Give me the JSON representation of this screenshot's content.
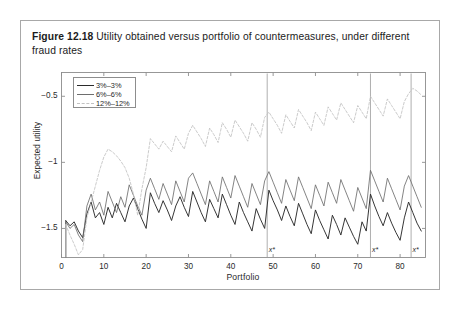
{
  "caption": {
    "label": "Figure 12.18",
    "text": "Utility obtained versus portfolio of countermeasures, under different fraud rates"
  },
  "colors": {
    "frame": "#8d8d8d",
    "series_3": "#2b2b2b",
    "series_6": "#6e6e6e",
    "series_12": "#c2c2c2",
    "text": "#231f20",
    "card_border": "#a8a8a8"
  },
  "legend": {
    "position": "top-left-inside",
    "items": [
      {
        "label": "3%–3%",
        "color": "#2b2b2b",
        "style": "solid"
      },
      {
        "label": "6%–6%",
        "color": "#6e6e6e",
        "style": "solid"
      },
      {
        "label": "12%–12%",
        "color": "#c2c2c2",
        "style": "dashed"
      }
    ]
  },
  "annotations": [
    {
      "label": "x*",
      "x": 48.6
    },
    {
      "label": "x*",
      "x": 73.0
    },
    {
      "label": "x*",
      "x": 82.6
    }
  ],
  "chart_data": {
    "type": "line",
    "title": "",
    "subtitle": "",
    "xlabel": "Portfolio",
    "ylabel": "Expected utility",
    "xlim": [
      0,
      86
    ],
    "ylim": [
      -1.72,
      -0.32
    ],
    "xticks": [
      0,
      10,
      20,
      30,
      40,
      50,
      60,
      70,
      80
    ],
    "yticks": [
      -0.5,
      -1,
      -1.5
    ],
    "ytick_labels": [
      "−0.5",
      "−1",
      "−1.5"
    ],
    "grid": false,
    "legend_position": "upper left",
    "series": [
      {
        "name": "3%–3%",
        "color": "#2b2b2b",
        "style": "solid",
        "x": [
          1,
          2,
          3,
          4,
          5,
          6,
          7,
          8,
          9,
          10,
          11,
          12,
          13,
          14,
          15,
          16,
          17,
          18,
          19,
          20,
          21,
          22,
          23,
          24,
          25,
          26,
          27,
          28,
          29,
          30,
          31,
          32,
          33,
          34,
          35,
          36,
          37,
          38,
          39,
          40,
          41,
          42,
          43,
          44,
          45,
          46,
          47,
          48,
          49,
          50,
          51,
          52,
          53,
          54,
          55,
          56,
          57,
          58,
          59,
          60,
          61,
          62,
          63,
          64,
          65,
          66,
          67,
          68,
          69,
          70,
          71,
          72,
          73,
          74,
          75,
          76,
          77,
          78,
          79,
          80,
          81,
          82,
          83,
          84,
          85
        ],
        "values": [
          -1.44,
          -1.48,
          -1.45,
          -1.52,
          -1.57,
          -1.39,
          -1.3,
          -1.42,
          -1.38,
          -1.47,
          -1.34,
          -1.42,
          -1.31,
          -1.38,
          -1.45,
          -1.33,
          -1.27,
          -1.35,
          -1.43,
          -1.5,
          -1.23,
          -1.31,
          -1.38,
          -1.29,
          -1.36,
          -1.44,
          -1.33,
          -1.26,
          -1.34,
          -1.41,
          -1.22,
          -1.3,
          -1.38,
          -1.45,
          -1.28,
          -1.35,
          -1.42,
          -1.24,
          -1.32,
          -1.4,
          -1.47,
          -1.3,
          -1.38,
          -1.45,
          -1.52,
          -1.35,
          -1.43,
          -1.5,
          -1.21,
          -1.29,
          -1.36,
          -1.44,
          -1.33,
          -1.41,
          -1.48,
          -1.31,
          -1.39,
          -1.47,
          -1.54,
          -1.36,
          -1.44,
          -1.51,
          -1.58,
          -1.4,
          -1.47,
          -1.55,
          -1.42,
          -1.49,
          -1.56,
          -1.62,
          -1.45,
          -1.52,
          -1.24,
          -1.33,
          -1.41,
          -1.48,
          -1.38,
          -1.46,
          -1.53,
          -1.59,
          -1.42,
          -1.3,
          -1.38,
          -1.46,
          -1.52
        ]
      },
      {
        "name": "6%–6%",
        "color": "#6e6e6e",
        "style": "solid",
        "x": [
          1,
          2,
          3,
          4,
          5,
          6,
          7,
          8,
          9,
          10,
          11,
          12,
          13,
          14,
          15,
          16,
          17,
          18,
          19,
          20,
          21,
          22,
          23,
          24,
          25,
          26,
          27,
          28,
          29,
          30,
          31,
          32,
          33,
          34,
          35,
          36,
          37,
          38,
          39,
          40,
          41,
          42,
          43,
          44,
          45,
          46,
          47,
          48,
          49,
          50,
          51,
          52,
          53,
          54,
          55,
          56,
          57,
          58,
          59,
          60,
          61,
          62,
          63,
          64,
          65,
          66,
          67,
          68,
          69,
          70,
          71,
          72,
          73,
          74,
          75,
          76,
          77,
          78,
          79,
          80,
          81,
          82,
          83,
          84,
          85
        ],
        "values": [
          -1.45,
          -1.5,
          -1.47,
          -1.55,
          -1.6,
          -1.33,
          -1.24,
          -1.36,
          -1.3,
          -1.4,
          -1.22,
          -1.3,
          -1.38,
          -1.26,
          -1.34,
          -1.17,
          -1.25,
          -1.33,
          -1.4,
          -1.21,
          -1.12,
          -1.2,
          -1.28,
          -1.16,
          -1.24,
          -1.32,
          -1.14,
          -1.22,
          -1.3,
          -1.12,
          -1.08,
          -1.16,
          -1.24,
          -1.32,
          -1.14,
          -1.22,
          -1.3,
          -1.11,
          -1.19,
          -1.27,
          -1.1,
          -1.18,
          -1.26,
          -1.34,
          -1.16,
          -1.24,
          -1.32,
          -1.14,
          -1.07,
          -1.15,
          -1.23,
          -1.31,
          -1.13,
          -1.21,
          -1.29,
          -1.11,
          -1.19,
          -1.27,
          -1.35,
          -1.17,
          -1.25,
          -1.33,
          -1.15,
          -1.23,
          -1.31,
          -1.13,
          -1.21,
          -1.29,
          -1.37,
          -1.19,
          -1.27,
          -1.35,
          -1.06,
          -1.14,
          -1.22,
          -1.3,
          -1.12,
          -1.2,
          -1.28,
          -1.36,
          -1.18,
          -1.1,
          -1.18,
          -1.26,
          -1.34
        ]
      },
      {
        "name": "12%–12%",
        "color": "#c2c2c2",
        "style": "dashed",
        "x": [
          1,
          2,
          3,
          4,
          5,
          6,
          7,
          8,
          9,
          10,
          11,
          12,
          13,
          14,
          15,
          16,
          17,
          18,
          19,
          20,
          21,
          22,
          23,
          24,
          25,
          26,
          27,
          28,
          29,
          30,
          31,
          32,
          33,
          34,
          35,
          36,
          37,
          38,
          39,
          40,
          41,
          42,
          43,
          44,
          45,
          46,
          47,
          48,
          49,
          50,
          51,
          52,
          53,
          54,
          55,
          56,
          57,
          58,
          59,
          60,
          61,
          62,
          63,
          64,
          65,
          66,
          67,
          68,
          69,
          70,
          71,
          72,
          73,
          74,
          75,
          76,
          77,
          78,
          79,
          80,
          81,
          82,
          83,
          84,
          85
        ],
        "values": [
          -1.47,
          -1.55,
          -1.62,
          -1.7,
          -1.66,
          -1.42,
          -1.3,
          -1.18,
          -1.06,
          -0.96,
          -0.9,
          -0.92,
          -0.95,
          -0.99,
          -1.04,
          -1.12,
          -1.24,
          -1.4,
          -1.2,
          -1.04,
          -0.82,
          -0.86,
          -0.9,
          -0.84,
          -0.88,
          -0.92,
          -0.8,
          -0.85,
          -0.9,
          -0.78,
          -0.72,
          -0.77,
          -0.82,
          -0.88,
          -0.74,
          -0.79,
          -0.85,
          -0.7,
          -0.75,
          -0.81,
          -0.68,
          -0.73,
          -0.78,
          -0.84,
          -0.7,
          -0.75,
          -0.81,
          -0.66,
          -0.62,
          -0.67,
          -0.72,
          -0.78,
          -0.64,
          -0.69,
          -0.74,
          -0.6,
          -0.65,
          -0.7,
          -0.76,
          -0.62,
          -0.67,
          -0.72,
          -0.58,
          -0.63,
          -0.68,
          -0.55,
          -0.6,
          -0.65,
          -0.7,
          -0.57,
          -0.62,
          -0.67,
          -0.5,
          -0.55,
          -0.6,
          -0.65,
          -0.52,
          -0.57,
          -0.62,
          -0.67,
          -0.54,
          -0.48,
          -0.44,
          -0.46,
          -0.49
        ]
      }
    ]
  }
}
